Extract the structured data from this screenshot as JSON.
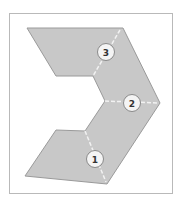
{
  "diagram": {
    "shape_fill": "#c8c8c8",
    "shape_stroke": "#9a9a9a",
    "divider_color": "#f2f2f2",
    "sections": [
      {
        "number": "1"
      },
      {
        "number": "2"
      },
      {
        "number": "3"
      }
    ]
  }
}
